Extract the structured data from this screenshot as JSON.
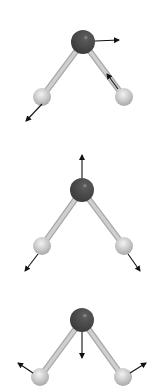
{
  "figure": {
    "colors": {
      "background": "#ffffff",
      "oxygen": "#4a4a4a",
      "hydrogen": "#c8c8c8",
      "bond": "#cfcfcf",
      "arrow": "#111111"
    },
    "modes": [
      {
        "name": "asymmetric-stretch",
        "oxygen": {
          "x": 83,
          "y": 42,
          "r": 12
        },
        "hydrogens": [
          {
            "x": 42,
            "y": 97,
            "r": 9
          },
          {
            "x": 124,
            "y": 97,
            "r": 9
          }
        ],
        "arrows": [
          {
            "x1": 95,
            "y1": 41,
            "x2": 119,
            "y2": 40
          },
          {
            "x1": 42,
            "y1": 104,
            "x2": 26,
            "y2": 121
          },
          {
            "x1": 118,
            "y1": 89,
            "x2": 107,
            "y2": 74
          }
        ]
      },
      {
        "name": "symmetric-stretch",
        "oxygen": {
          "x": 82,
          "y": 190,
          "r": 12
        },
        "hydrogens": [
          {
            "x": 42,
            "y": 246,
            "r": 9
          },
          {
            "x": 124,
            "y": 246,
            "r": 9
          }
        ],
        "arrows": [
          {
            "x1": 82,
            "y1": 178,
            "x2": 82,
            "y2": 155
          },
          {
            "x1": 38,
            "y1": 254,
            "x2": 25,
            "y2": 271
          },
          {
            "x1": 128,
            "y1": 254,
            "x2": 140,
            "y2": 271
          }
        ]
      },
      {
        "name": "bending",
        "oxygen": {
          "x": 82,
          "y": 320,
          "r": 12
        },
        "hydrogens": [
          {
            "x": 40,
            "y": 377,
            "r": 9
          },
          {
            "x": 123,
            "y": 377,
            "r": 9
          }
        ],
        "arrows": [
          {
            "x1": 82,
            "y1": 332,
            "x2": 82,
            "y2": 358
          },
          {
            "x1": 33,
            "y1": 373,
            "x2": 18,
            "y2": 363
          },
          {
            "x1": 130,
            "y1": 373,
            "x2": 146,
            "y2": 363
          }
        ]
      }
    ]
  }
}
